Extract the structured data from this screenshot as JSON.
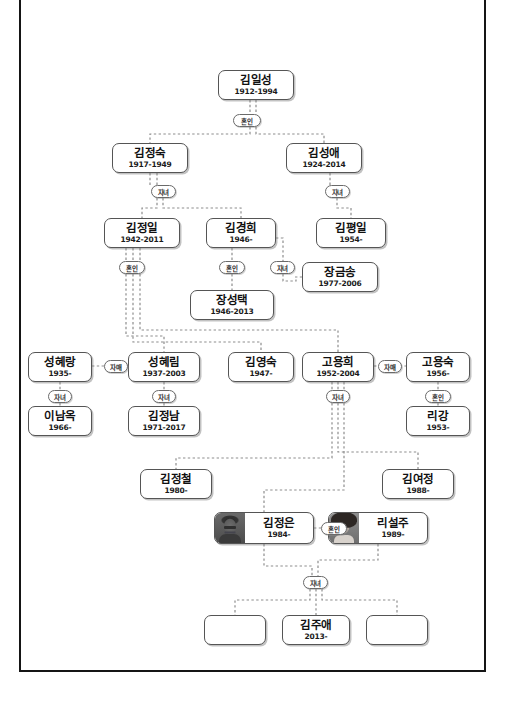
{
  "diagram": {
    "relation_labels": {
      "marriage": "혼인",
      "children": "자녀",
      "siblings": "자매"
    },
    "colors": {
      "frame": "#151515",
      "node_border": "#555555",
      "connector": "#8a8a8a",
      "background": "#ffffff"
    }
  },
  "nodes": [
    {
      "id": "kim_il_sung",
      "name": "김일성",
      "years": "1912-1994",
      "x": 218,
      "y": 70,
      "w": 76,
      "h": 30,
      "photo": null
    },
    {
      "id": "kim_jong_suk",
      "name": "김정숙",
      "years": "1917-1949",
      "x": 112,
      "y": 143,
      "w": 76,
      "h": 30,
      "photo": null
    },
    {
      "id": "kim_song_ae",
      "name": "김성애",
      "years": "1924-2014",
      "x": 286,
      "y": 143,
      "w": 76,
      "h": 30,
      "photo": null
    },
    {
      "id": "kim_jong_il",
      "name": "김정일",
      "years": "1942-2011",
      "x": 104,
      "y": 218,
      "w": 76,
      "h": 30,
      "photo": null
    },
    {
      "id": "kim_kyong_hui",
      "name": "김경희",
      "years": "1946-",
      "x": 206,
      "y": 218,
      "w": 70,
      "h": 30,
      "photo": null
    },
    {
      "id": "kim_pyong_il",
      "name": "김평일",
      "years": "1954-",
      "x": 316,
      "y": 218,
      "w": 70,
      "h": 30,
      "photo": null
    },
    {
      "id": "jang_kum_song",
      "name": "장금송",
      "years": "1977-2006",
      "x": 302,
      "y": 262,
      "w": 76,
      "h": 30,
      "photo": null
    },
    {
      "id": "jang_song_thaek",
      "name": "장성택",
      "years": "1946-2013",
      "x": 190,
      "y": 290,
      "w": 84,
      "h": 30,
      "photo": null
    },
    {
      "id": "song_hye_rang",
      "name": "성혜랑",
      "years": "1935-",
      "x": 28,
      "y": 352,
      "w": 64,
      "h": 30,
      "photo": null
    },
    {
      "id": "song_hye_rim",
      "name": "성혜림",
      "years": "1937-2003",
      "x": 128,
      "y": 352,
      "w": 72,
      "h": 30,
      "photo": null
    },
    {
      "id": "kim_young_sook",
      "name": "김영숙",
      "years": "1947-",
      "x": 228,
      "y": 352,
      "w": 66,
      "h": 30,
      "photo": null
    },
    {
      "id": "ko_yong_hui",
      "name": "고용희",
      "years": "1952-2004",
      "x": 302,
      "y": 352,
      "w": 72,
      "h": 30,
      "photo": null
    },
    {
      "id": "ko_yong_suk",
      "name": "고용숙",
      "years": "1956-",
      "x": 406,
      "y": 352,
      "w": 64,
      "h": 30,
      "photo": null
    },
    {
      "id": "lee_nam_ok",
      "name": "이남옥",
      "years": "1966-",
      "x": 28,
      "y": 406,
      "w": 64,
      "h": 30,
      "photo": null
    },
    {
      "id": "kim_jong_nam",
      "name": "김정남",
      "years": "1971-2017",
      "x": 128,
      "y": 406,
      "w": 72,
      "h": 30,
      "photo": null
    },
    {
      "id": "ri_gang",
      "name": "리강",
      "years": "1953-",
      "x": 406,
      "y": 406,
      "w": 64,
      "h": 30,
      "photo": null
    },
    {
      "id": "kim_jong_chul",
      "name": "김정철",
      "years": "1980-",
      "x": 140,
      "y": 469,
      "w": 72,
      "h": 30,
      "photo": null
    },
    {
      "id": "kim_yo_jong",
      "name": "김여정",
      "years": "1988-",
      "x": 382,
      "y": 469,
      "w": 72,
      "h": 30,
      "photo": null
    },
    {
      "id": "kim_jong_un",
      "name": "김정은",
      "years": "1984-",
      "x": 214,
      "y": 512,
      "w": 100,
      "h": 32,
      "photo": "kju"
    },
    {
      "id": "ri_sol_ju",
      "name": "리설주",
      "years": "1989-",
      "x": 328,
      "y": 512,
      "w": 100,
      "h": 32,
      "photo": "rsj"
    },
    {
      "id": "unnamed_left",
      "name": "",
      "years": "",
      "x": 204,
      "y": 615,
      "w": 62,
      "h": 30,
      "photo": null
    },
    {
      "id": "kim_ju_ae",
      "name": "김주애",
      "years": "2013-",
      "x": 282,
      "y": 615,
      "w": 68,
      "h": 30,
      "photo": null
    },
    {
      "id": "unnamed_right",
      "name": "",
      "years": "",
      "x": 366,
      "y": 615,
      "w": 62,
      "h": 30,
      "photo": null
    }
  ],
  "pills": [
    {
      "id": "p_marriage_ils",
      "label": "혼인",
      "x": 233,
      "y": 114,
      "w": 28
    },
    {
      "id": "p_child_jongsuk",
      "label": "자녀",
      "x": 151,
      "y": 185,
      "w": 25
    },
    {
      "id": "p_child_songae",
      "label": "자녀",
      "x": 325,
      "y": 185,
      "w": 25
    },
    {
      "id": "p_marriage_kji",
      "label": "혼인",
      "x": 119,
      "y": 261,
      "w": 26
    },
    {
      "id": "p_marriage_kkh",
      "label": "혼인",
      "x": 219,
      "y": 261,
      "w": 26
    },
    {
      "id": "p_child_kkh",
      "label": "자녀",
      "x": 270,
      "y": 261,
      "w": 25
    },
    {
      "id": "p_sis_song",
      "label": "자매",
      "x": 104,
      "y": 360,
      "w": 24
    },
    {
      "id": "p_sis_ko",
      "label": "자매",
      "x": 378,
      "y": 360,
      "w": 24
    },
    {
      "id": "p_child_shr",
      "label": "자녀",
      "x": 48,
      "y": 390,
      "w": 24
    },
    {
      "id": "p_child_shl",
      "label": "자녀",
      "x": 152,
      "y": 390,
      "w": 24
    },
    {
      "id": "p_child_kyh",
      "label": "자녀",
      "x": 326,
      "y": 390,
      "w": 24
    },
    {
      "id": "p_marriage_kys",
      "label": "혼인",
      "x": 425,
      "y": 390,
      "w": 26
    },
    {
      "id": "p_marriage_kju",
      "label": "혼인",
      "x": 321,
      "y": 522,
      "w": 26
    },
    {
      "id": "p_child_kju",
      "label": "자녀",
      "x": 303,
      "y": 576,
      "w": 25
    }
  ]
}
